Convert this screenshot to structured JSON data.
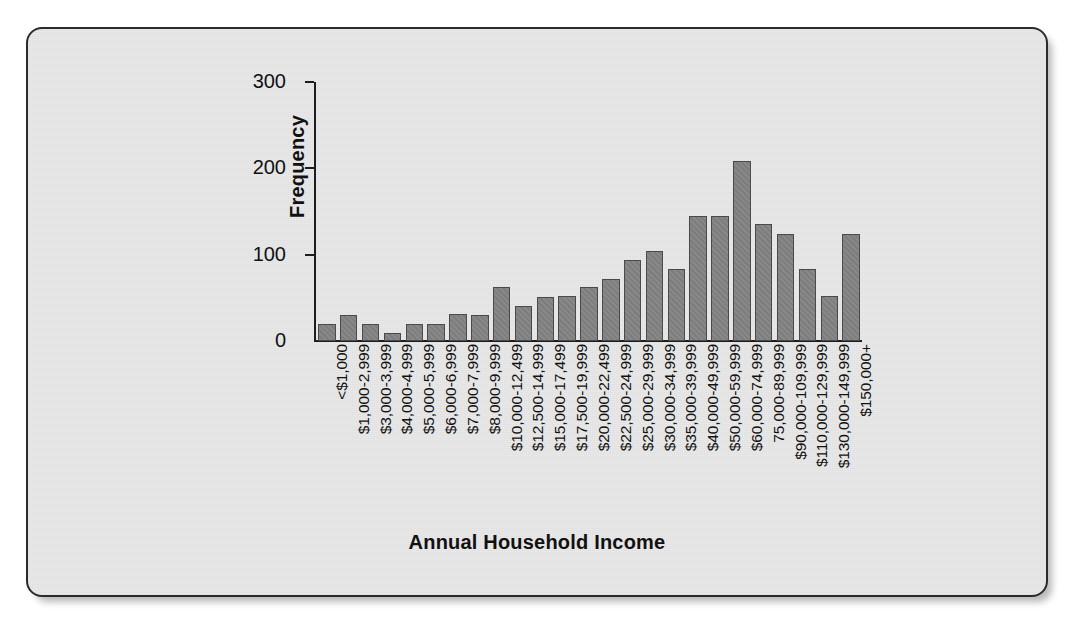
{
  "chart_data": {
    "type": "bar",
    "title": "",
    "xlabel": "Annual Household Income",
    "ylabel": "Frequency",
    "ylim": [
      0,
      300
    ],
    "yticks": [
      0,
      100,
      200,
      300
    ],
    "ytick_labels": [
      "0",
      "100",
      "200",
      "300"
    ],
    "grid": false,
    "legend": "none",
    "bar_color": "#828282",
    "bar_edge_color": "#4a4a4a",
    "background_color": "#e9e9e9",
    "axis_color": "#1d1d1d",
    "categories": [
      "<$1,000",
      "$1,000-2,999",
      "$3,000-3,999",
      "$4,000-4,999",
      "$5,000-5,999",
      "$6,000-6,999",
      "$7,000-7,999",
      "$8,000-9,999",
      "$10,000-12,499",
      "$12,500-14,999",
      "$15,000-17,499",
      "$17,500-19,999",
      "$20,000-22,499",
      "$22,500-24,999",
      "$25,000-29,999",
      "$30,000-34,999",
      "$35,000-39,999",
      "$40,000-49,999",
      "$50,000-59,999",
      "$60,000-74,999",
      "75,000-89,999",
      "$90,000-109,999",
      "$110,000-129,999",
      "$130,000-149,999",
      "$150,000+"
    ],
    "values": [
      20,
      30,
      20,
      9,
      20,
      20,
      31,
      30,
      62,
      41,
      51,
      52,
      62,
      72,
      94,
      104,
      83,
      145,
      145,
      209,
      135,
      124,
      83,
      52,
      124
    ]
  }
}
